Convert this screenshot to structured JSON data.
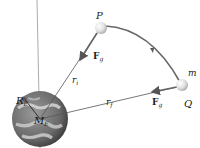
{
  "diagram": {
    "points": {
      "P": {
        "label": "P",
        "x": 101,
        "y": 28
      },
      "Q": {
        "label": "Q",
        "x": 182,
        "y": 85
      }
    },
    "mass_label": "m",
    "earth": {
      "radius_label": "R",
      "radius_sub": "E",
      "mass_label": "M",
      "mass_sub": "E"
    },
    "vectors": {
      "force_P": {
        "label": "F",
        "sub": "g"
      },
      "force_Q": {
        "label": "F",
        "sub": "g"
      }
    },
    "distances": {
      "initial": {
        "label": "r",
        "sub": "i"
      },
      "final": {
        "label": "r",
        "sub": "f"
      }
    },
    "colors": {
      "path": "#666666",
      "lines": "#555555",
      "particle": "#e6e6e6",
      "earth_ocean": "#5a5a5a",
      "earth_cloud": "#d8d8d8"
    }
  }
}
